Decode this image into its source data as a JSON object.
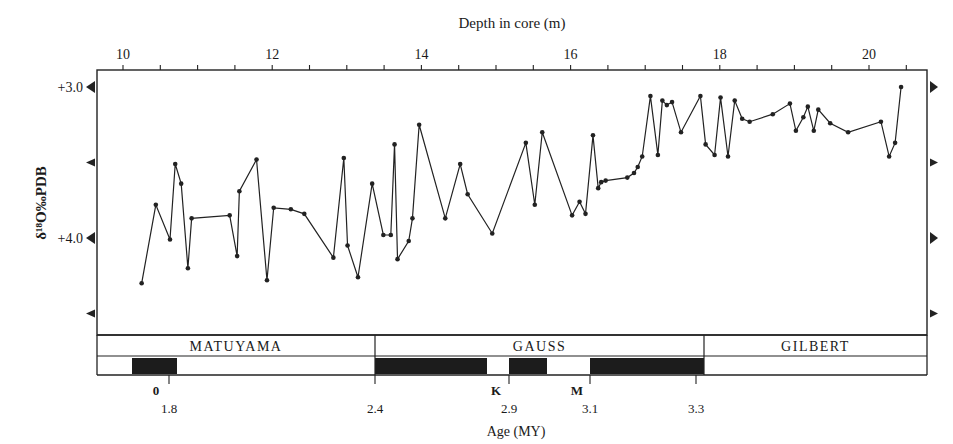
{
  "chart_data": {
    "type": "line",
    "title": "",
    "top_axis": {
      "label": "Depth in core (m)",
      "ticks": [
        10,
        12,
        14,
        16,
        18,
        20
      ],
      "minor_ticks_step": 0.5,
      "range": [
        9.7,
        20.7
      ]
    },
    "ylabel": "δ18O‰PDB",
    "ylabel_display": "δ¹⁸O‰PDB",
    "y_ticks": [
      {
        "value": 3.0,
        "label": "+3.0"
      },
      {
        "value": 3.5,
        "label": ""
      },
      {
        "value": 4.0,
        "label": "+4.0"
      },
      {
        "value": 4.5,
        "label": ""
      }
    ],
    "ylim": [
      2.9,
      4.65
    ],
    "y_inverted": true,
    "grid": false,
    "series": [
      {
        "name": "δ18O",
        "x": [
          10.25,
          10.44,
          10.63,
          10.7,
          10.78,
          10.87,
          10.92,
          11.43,
          11.53,
          11.56,
          11.79,
          11.93,
          12.02,
          12.25,
          12.43,
          12.82,
          12.96,
          13.01,
          13.15,
          13.34,
          13.49,
          13.59,
          13.64,
          13.68,
          13.83,
          13.88,
          13.97,
          14.32,
          14.52,
          14.62,
          14.95,
          15.4,
          15.52,
          15.62,
          16.02,
          16.12,
          16.2,
          16.3,
          16.37,
          16.41,
          16.47,
          16.76,
          16.85,
          16.9,
          16.96,
          17.07,
          17.17,
          17.23,
          17.29,
          17.36,
          17.48,
          17.74,
          17.81,
          17.93,
          18.01,
          18.11,
          18.2,
          18.3,
          18.4,
          18.71,
          18.94,
          19.02,
          19.12,
          19.18,
          19.26,
          19.32,
          19.48,
          19.72,
          20.16,
          20.27,
          20.35,
          20.43
        ],
        "y": [
          4.3,
          3.78,
          4.01,
          3.51,
          3.64,
          4.2,
          3.87,
          3.85,
          4.12,
          3.69,
          3.48,
          4.28,
          3.8,
          3.81,
          3.84,
          4.13,
          3.47,
          4.05,
          4.26,
          3.64,
          3.98,
          3.98,
          3.38,
          4.14,
          4.02,
          3.87,
          3.25,
          3.87,
          3.51,
          3.71,
          3.97,
          3.37,
          3.78,
          3.3,
          3.85,
          3.76,
          3.84,
          3.32,
          3.67,
          3.63,
          3.62,
          3.6,
          3.57,
          3.53,
          3.46,
          3.06,
          3.45,
          3.09,
          3.12,
          3.1,
          3.3,
          3.06,
          3.38,
          3.45,
          3.07,
          3.46,
          3.09,
          3.21,
          3.23,
          3.18,
          3.11,
          3.29,
          3.2,
          3.13,
          3.29,
          3.15,
          3.24,
          3.3,
          3.23,
          3.46,
          3.37,
          3.0
        ]
      }
    ],
    "magnetostratigraphy": {
      "epochs": [
        {
          "name": "MATUYAMA",
          "x_start_px": 97,
          "x_end_px": 375
        },
        {
          "name": "GAUSS",
          "x_start_px": 375,
          "x_end_px": 704
        },
        {
          "name": "GILBERT",
          "x_start_px": 704,
          "x_end_px": 927
        }
      ],
      "normal_polarity_blocks_px": [
        [
          132,
          177
        ],
        [
          375,
          487
        ],
        [
          509,
          547
        ],
        [
          590,
          704
        ]
      ],
      "events": [
        {
          "label": "0",
          "sublabel": "1.8",
          "x_px": 169
        },
        {
          "label": "",
          "sublabel": "2.4",
          "x_px": 375
        },
        {
          "label": "K",
          "sublabel": "2.9",
          "x_px": 509
        },
        {
          "label": "M",
          "sublabel": "3.1",
          "x_px": 590
        },
        {
          "label": "",
          "sublabel": "3.3",
          "x_px": 696
        }
      ],
      "axis_label": "Age (MY)"
    }
  }
}
